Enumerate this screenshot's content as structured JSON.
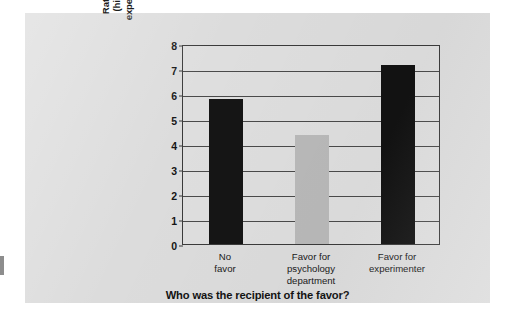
{
  "chart_data": {
    "type": "bar",
    "title": "",
    "xlabel": "Who was the recipient of the favor?",
    "ylabel": "Rating of experimenter (higher scores means experimenter better liked)",
    "ylabel_lines": [
      "Rating of experimenter",
      "(higher scores means",
      "experimenter better liked)"
    ],
    "categories": [
      "No favor",
      "Favor for psychology department",
      "Favor for experimenter"
    ],
    "category_lines": [
      [
        "No",
        "favor"
      ],
      [
        "Favor for",
        "psychology",
        "department"
      ],
      [
        "Favor for",
        "experimenter"
      ]
    ],
    "values": [
      5.8,
      4.35,
      7.15
    ],
    "bar_colors": [
      "#151515",
      "#b9b9b9",
      "#121212"
    ],
    "ylim": [
      0,
      8
    ],
    "ytick_labels": [
      "0",
      "1",
      "2",
      "3",
      "4",
      "5",
      "6",
      "7",
      "8"
    ],
    "ytick_values": [
      0,
      1,
      2,
      3,
      4,
      5,
      6,
      7,
      8
    ],
    "grid": true,
    "legend": "none",
    "panel_color": "#dcdcdc",
    "axis_color": "#3a3a3a"
  }
}
